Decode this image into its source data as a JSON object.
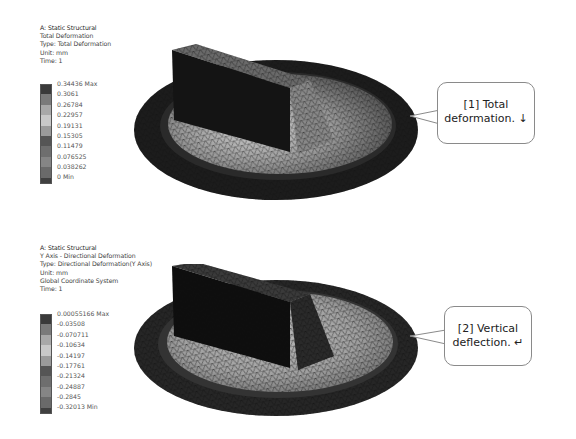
{
  "panels": [
    {
      "info": {
        "analysis": "A: Static Structural",
        "result_name": "Total Deformation",
        "type": "Type: Total Deformation",
        "unit": "Unit: mm",
        "extra": "",
        "time": "Time: 1"
      },
      "legend": {
        "labels": [
          "0.34436 Max",
          "0.3061",
          "0.26784",
          "0.22957",
          "0.19131",
          "0.15305",
          "0.11479",
          "0.076525",
          "0.038262",
          "0 Min"
        ],
        "swatches": [
          "#3a3a3a",
          "#7a7a7a",
          "#a8a8a8",
          "#c8c8c8",
          "#9a9a9a",
          "#555555",
          "#6e6e6e",
          "#858585",
          "#6a6a6a",
          "#404040"
        ]
      },
      "callout": {
        "line1": "[1] Total",
        "line2": "deformation. ↓",
        "icon": "down-arrow"
      }
    },
    {
      "info": {
        "analysis": "A: Static Structural",
        "result_name": "Y Axis - Directional Deformation",
        "type": "Type: Directional Deformation(Y Axis)",
        "unit": "Unit: mm",
        "extra": "Global Coordinate System",
        "time": "Time: 1"
      },
      "legend": {
        "labels": [
          "0.00055166 Max",
          "-0.03508",
          "-0.070711",
          "-0.10634",
          "-0.14197",
          "-0.17761",
          "-0.21324",
          "-0.24887",
          "-0.2845",
          "-0.32013 Min"
        ],
        "swatches": [
          "#3a3a3a",
          "#7a7a7a",
          "#a8a8a8",
          "#c8c8c8",
          "#9a9a9a",
          "#555555",
          "#6e6e6e",
          "#858585",
          "#6a6a6a",
          "#404040"
        ]
      },
      "callout": {
        "line1": "[2] Vertical",
        "line2": "deflection. ↵",
        "icon": "return-arrow"
      }
    }
  ]
}
